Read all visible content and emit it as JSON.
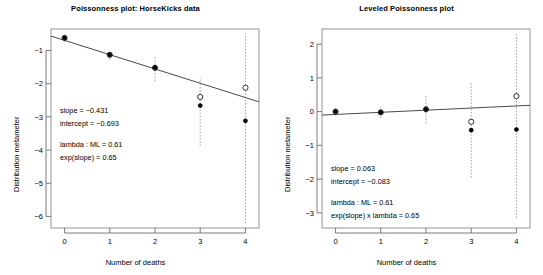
{
  "figure": {
    "width": 543,
    "height": 275,
    "background": "#ffffff",
    "line_color": "#4a4a4a",
    "frame_color": "#7a7a7a"
  },
  "chart_data": [
    {
      "type": "scatter",
      "panel": "left",
      "title": "Poissonness plot: HorseKicks data",
      "xlabel": "Number of deaths",
      "ylabel": "Distribution metameter",
      "x": [
        0,
        1,
        2,
        3,
        4
      ],
      "xticklabels": [
        "0",
        "1",
        "2",
        "3",
        "4"
      ],
      "yticks": [
        -1,
        -2,
        -3,
        -4,
        -5,
        -6
      ],
      "yticklabels": [
        "-1",
        "-2",
        "-3",
        "-4",
        "-5",
        "-6"
      ],
      "xlim": [
        -0.3,
        4.3
      ],
      "ylim": [
        -6.35,
        -0.35
      ],
      "grid": false,
      "legend": null,
      "series": [
        {
          "name": "observed metameter",
          "marker": "filled-circle",
          "values": [
            -0.62,
            -1.13,
            -1.52,
            -2.66,
            -3.12
          ]
        },
        {
          "name": "level-adjusted metameter",
          "marker": "open-circle",
          "values": [
            -0.62,
            -1.13,
            -1.52,
            -2.4,
            -2.12
          ]
        }
      ],
      "error_bars": {
        "style": "dotted-vertical",
        "lower": [
          -0.74,
          -1.28,
          -1.92,
          -3.88,
          -6.2
        ],
        "upper": [
          -0.52,
          -0.99,
          -1.18,
          -1.82,
          -0.48
        ]
      },
      "fit_line": {
        "slope": -0.431,
        "intercept": -0.693
      },
      "annotations": [
        "slope = −0.431",
        "intercept = −0.693",
        "lambda : ML = 0.61",
        "exp(slope) = 0.65"
      ]
    },
    {
      "type": "scatter",
      "panel": "right",
      "title": "Leveled Poissonness plot",
      "xlabel": "Number of deaths",
      "ylabel": "Distribution metameter",
      "x": [
        0,
        1,
        2,
        3,
        4
      ],
      "xticklabels": [
        "0",
        "1",
        "2",
        "3",
        "4"
      ],
      "yticks": [
        2,
        1,
        0,
        -1,
        -2,
        -3
      ],
      "yticklabels": [
        "2",
        "1",
        "0",
        "-1",
        "-2",
        "-3"
      ],
      "xlim": [
        -0.3,
        4.3
      ],
      "ylim": [
        -3.45,
        2.45
      ],
      "grid": false,
      "legend": null,
      "series": [
        {
          "name": "observed metameter",
          "marker": "filled-circle",
          "values": [
            0.0,
            -0.02,
            0.07,
            -0.55,
            -0.53
          ]
        },
        {
          "name": "level-adjusted metameter",
          "marker": "open-circle",
          "values": [
            0.0,
            -0.02,
            0.07,
            -0.3,
            0.46
          ]
        }
      ],
      "error_bars": {
        "style": "dotted-vertical",
        "lower": [
          -0.12,
          -0.18,
          -0.35,
          -1.95,
          -3.15
        ],
        "upper": [
          0.1,
          0.14,
          0.47,
          0.9,
          2.3
        ]
      },
      "fit_line": {
        "slope": 0.063,
        "intercept": -0.083
      },
      "annotations": [
        "slope = 0.063",
        "intercept = −0.083",
        "lambda : ML = 0.61",
        "exp(slope) x lambda = 0.65"
      ]
    }
  ]
}
